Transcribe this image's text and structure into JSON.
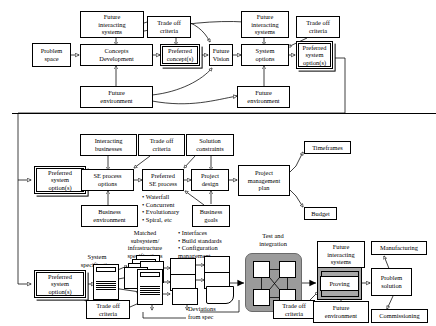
{
  "diagram": {
    "stage1": {
      "nodes": {
        "problem_space": "Problem\nspace",
        "future_interacting_systems_1": "Future\ninteracting\nsystems",
        "trade_off_criteria_1": "Trade off\ncriteria",
        "concepts_development": "Concepts\nDevelopment",
        "preferred_concepts": "Preferred\nconcept(s)",
        "future_environment_1": "Future\nenvironment",
        "future_vision": "Future\nVision",
        "future_interacting_systems_2": "Future\ninteracting\nsystems",
        "trade_off_criteria_2": "Trade off\ncriteria",
        "system_options": "System\noptions",
        "preferred_system_options_1": "Preferred\nsystem\noption(s)",
        "future_environment_2": "Future\nenvironment"
      }
    },
    "stage2": {
      "nodes": {
        "preferred_system_options_2": "Preferred\nsystem\noption(s)",
        "interacting_businesses": "Interacting\nbusinesses",
        "trade_off_criteria_3": "Trade off\ncriteria",
        "solution_constraints": "Solution\nconstraints",
        "se_process_options": "SE process\noptions",
        "preferred_se_process": "Preferred\nSE process",
        "project_design": "Project\ndesign",
        "project_management_plan": "Project\nmanagement\nplan",
        "business_environment": "Business\nenvironment",
        "business_goals": "Business\ngoals",
        "timeframes": "Timeframes",
        "budget": "Budget"
      },
      "process_list": "• Waterfall\n• Concurrent\n• Evolutionary\n• Spiral, etc"
    },
    "stage3": {
      "nodes": {
        "preferred_system_options_3": "Preferred\nsystem\noption(s)",
        "trade_off_criteria_4": "Trade off\ncriteria",
        "trade_off_criteria_5": "Trade off\ncriteria",
        "proving": "Proving",
        "future_interacting_systems_3": "Future\ninteracting\nsystems",
        "future_environment_3": "Future\nenvironment",
        "problem_solution": "Problem\nsolution",
        "manufacturing": "Manufacturing",
        "commissioning": "Commissioning"
      },
      "labels": {
        "system_specification": "System\nspecification",
        "matched_subsystem": "Matched\nsubsystem/\ninfrastructure\nspecifications",
        "build_list": "• Interfaces\n• Build standards\n• Configuration\n  management",
        "test_and_integration": "Test and\nintegration",
        "deviations_from_spec": "Deviations\nfrom spec"
      }
    },
    "colors": {
      "line": "#000000",
      "cluster_fill": "#9b9b9b",
      "proving_fill": "#a8a8a8",
      "background": "#ffffff"
    }
  }
}
